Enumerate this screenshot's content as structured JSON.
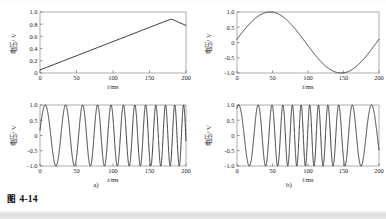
{
  "figure": {
    "caption_prefix": "图",
    "caption_number": "4-14",
    "sublabels": [
      "a)",
      "b)"
    ]
  },
  "axis_text": {
    "ylabel_cjk": "电压",
    "ylabel_unit": "/ V",
    "xlabel_var": "t",
    "xlabel_unit": "/ms"
  },
  "chart_data": [
    {
      "id": "panel-a-top",
      "type": "line",
      "title": "",
      "xlabel": "t/ms",
      "ylabel": "电压 / V",
      "xlim": [
        0,
        200
      ],
      "ylim": [
        0,
        1.0
      ],
      "xticks": [
        0,
        50,
        100,
        150,
        200
      ],
      "xticklabels": [
        "0",
        "50",
        "100",
        "150",
        "200"
      ],
      "yticks": [
        0,
        0.2,
        0.4,
        0.6,
        0.8,
        1.0
      ],
      "yticklabels": [
        "0",
        "0.2",
        "0.4",
        "0.6",
        "0.8",
        "1.0"
      ],
      "grid": false,
      "legend": "none",
      "description": "sawtooth / linear ramp modulating signal",
      "series": [
        {
          "name": "modulating ramp",
          "points": [
            [
              0,
              0.05
            ],
            [
              10,
              0.097
            ],
            [
              20,
              0.143
            ],
            [
              30,
              0.19
            ],
            [
              40,
              0.236
            ],
            [
              50,
              0.283
            ],
            [
              60,
              0.329
            ],
            [
              70,
              0.376
            ],
            [
              80,
              0.422
            ],
            [
              90,
              0.469
            ],
            [
              100,
              0.515
            ],
            [
              110,
              0.562
            ],
            [
              120,
              0.608
            ],
            [
              130,
              0.655
            ],
            [
              140,
              0.701
            ],
            [
              150,
              0.748
            ],
            [
              160,
              0.794
            ],
            [
              170,
              0.841
            ],
            [
              180,
              0.883
            ],
            [
              185,
              0.86
            ],
            [
              190,
              0.83
            ],
            [
              195,
              0.805
            ],
            [
              200,
              0.78
            ]
          ]
        }
      ]
    },
    {
      "id": "panel-a-bottom",
      "type": "line",
      "title": "",
      "xlabel": "t/ms",
      "ylabel": "电压 / V",
      "xlim": [
        0,
        200
      ],
      "ylim": [
        -1.0,
        1.0
      ],
      "xticks": [
        0,
        50,
        100,
        150,
        200
      ],
      "xticklabels": [
        "0",
        "50",
        "100",
        "150",
        "200"
      ],
      "yticks": [
        -1.0,
        -0.5,
        0,
        0.5,
        1.0
      ],
      "yticklabels": [
        "-1.0",
        "-0.5",
        "0",
        "0.5",
        "1.0"
      ],
      "grid": false,
      "legend": "none",
      "description": "FM carrier chirp: instantaneous frequency rises linearly with the ramp, about 12 cycles across 200 ms",
      "formula": {
        "kind": "fm_linear_chirp",
        "amplitude": 1.0,
        "f_start_hz": 30,
        "f_end_hz": 85,
        "phase0_deg": 10,
        "samples": 2400
      }
    },
    {
      "id": "panel-b-top",
      "type": "line",
      "title": "",
      "xlabel": "t/ms",
      "ylabel": "电压 / V",
      "xlim": [
        0,
        200
      ],
      "ylim": [
        -1.0,
        1.0
      ],
      "xticks": [
        0,
        50,
        100,
        150,
        200
      ],
      "xticklabels": [
        "0",
        "50",
        "100",
        "150",
        "200"
      ],
      "yticks": [
        -1.0,
        -0.5,
        0,
        0.5,
        1.0
      ],
      "yticklabels": [
        "-1.0",
        "-0.5",
        "0",
        "0.5",
        "1.0"
      ],
      "grid": false,
      "legend": "none",
      "description": "single-cycle 5 Hz sinusoidal modulating signal, starts near 0.1 V rising, peak +1.0 at 50 ms, min -1.0 at 150 ms",
      "formula": {
        "kind": "sine",
        "amplitude": 1.0,
        "frequency_hz": 5,
        "phase0_deg": 6,
        "samples": 800
      }
    },
    {
      "id": "panel-b-bottom",
      "type": "line",
      "title": "",
      "xlabel": "t/ms",
      "ylabel": "电压 / V",
      "xlim": [
        0,
        200
      ],
      "ylim": [
        -1.0,
        1.0
      ],
      "xticks": [
        0,
        50,
        100,
        150,
        200
      ],
      "xticklabels": [
        "0",
        "50",
        "100",
        "150",
        "200"
      ],
      "yticks": [
        -1.0,
        -0.5,
        0,
        0.5,
        1.0
      ],
      "yticklabels": [
        "-1.0",
        "-0.5",
        "0",
        "0.5",
        "1.0"
      ],
      "grid": false,
      "legend": "none",
      "description": "FM carrier with sinusoidal modulation: frequency highest at t=0 and t=200 ms, lowest near t=100-130 ms",
      "formula": {
        "kind": "fm_sine",
        "amplitude": 1.0,
        "carrier_hz": 57,
        "deviation_hz": 26,
        "mod_hz": 5,
        "mod_phase_deg": 6,
        "phase0_deg": 95,
        "samples": 2600
      }
    }
  ]
}
